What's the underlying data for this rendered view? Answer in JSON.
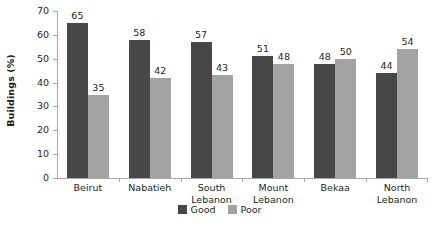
{
  "chart_data": {
    "type": "bar",
    "title": "",
    "xlabel": "",
    "ylabel": "Buildings (%)",
    "ylim": [
      0,
      70
    ],
    "ytick_step": 10,
    "yticks": [
      70,
      60,
      50,
      40,
      30,
      20,
      10,
      0
    ],
    "grid": false,
    "legend_position": "bottom-center",
    "categories": [
      {
        "lines": [
          "Beirut"
        ]
      },
      {
        "lines": [
          "Nabatieh"
        ]
      },
      {
        "lines": [
          "South",
          "Lebanon"
        ]
      },
      {
        "lines": [
          "Mount",
          "Lebanon"
        ]
      },
      {
        "lines": [
          "Bekaa"
        ]
      },
      {
        "lines": [
          "North",
          "Lebanon"
        ]
      }
    ],
    "series": [
      {
        "name": "Good",
        "color": "#474747",
        "values": [
          65,
          58,
          57,
          51,
          48,
          44
        ]
      },
      {
        "name": "Poor",
        "color": "#a3a3a3",
        "values": [
          35,
          42,
          43,
          48,
          50,
          54
        ]
      }
    ]
  },
  "colors": {
    "good": "#474747",
    "poor": "#a3a3a3",
    "axis": "#a7a9ac",
    "text": "#231f20",
    "background": "#ffffff"
  }
}
